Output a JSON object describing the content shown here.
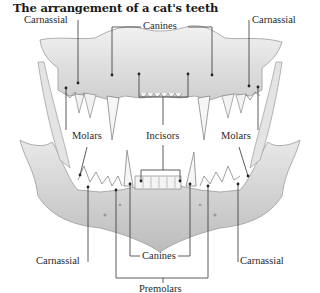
{
  "title": "The arrangement of a cat's teeth",
  "upper_jaw": {
    "labels": {
      "carnassial_left": "Carnassial",
      "canines": "Canines",
      "carnassial_right": "Carnassial",
      "molars_left": "Molars",
      "incisors": "Incisors",
      "molars_right": "Molars"
    }
  },
  "lower_jaw": {
    "labels": {
      "carnassial_left": "Carnassial",
      "canines": "Canines",
      "carnassial_right": "Carnassial",
      "premolars": "Premolars"
    }
  },
  "colors": {
    "bone": "#e6e6e6",
    "bone_shadow": "#bdbdbd",
    "outline": "#8a8a8a",
    "leader_line": "#333333",
    "text": "#2a2a2a"
  }
}
